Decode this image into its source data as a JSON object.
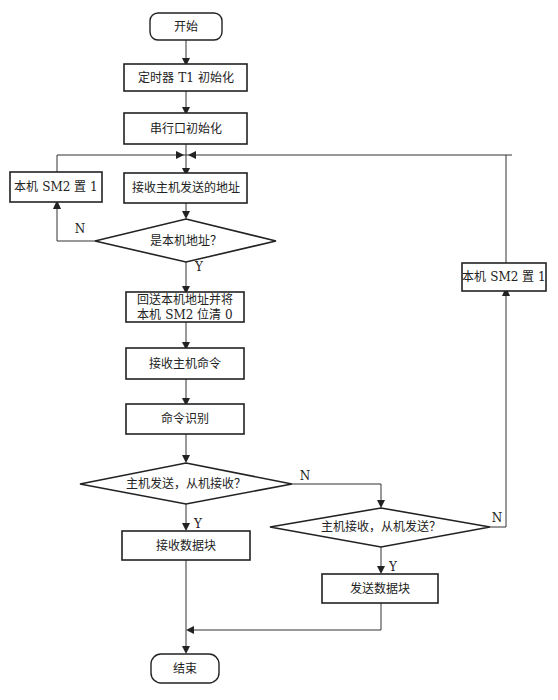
{
  "flowchart": {
    "start": "开始",
    "end": "结束",
    "steps": {
      "timer_init": "定时器 T1  初始化",
      "serial_init": "串行口初始化",
      "recv_addr": "接收主机发送的地址",
      "set_sm2_left": "本机 SM2 置 1",
      "reply_addr_line1": "回送本机地址并将",
      "reply_addr_line2": "本机 SM2 位清 0",
      "recv_cmd": "接收主机命令",
      "cmd_identify": "命令识别",
      "recv_block": "接收数据块",
      "send_block": "发送数据块",
      "set_sm2_right": "本机 SM2 置 1"
    },
    "decisions": {
      "is_my_addr": "是本机地址？",
      "master_send": "主机发送，从机接收？",
      "master_recv": "主机接收，从机发送？"
    },
    "labels": {
      "yes": "Y",
      "no": "N"
    }
  }
}
